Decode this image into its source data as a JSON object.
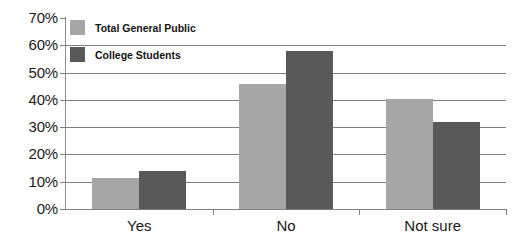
{
  "chart_data": {
    "type": "bar",
    "title": "",
    "subtitle": "",
    "xlabel": "",
    "ylabel": "",
    "categories": [
      "Yes",
      "No",
      "Not sure"
    ],
    "series": [
      {
        "name": "Total General Public",
        "color": "#a6a6a6",
        "values": [
          11.5,
          46,
          40.5
        ]
      },
      {
        "name": "College Students",
        "color": "#595959",
        "values": [
          14,
          58,
          32
        ]
      }
    ],
    "ylim": [
      0,
      70
    ],
    "ytick_values": [
      0,
      10,
      20,
      30,
      40,
      50,
      60,
      70
    ],
    "ytick_labels": [
      "0%",
      "10%",
      "20%",
      "30%",
      "40%",
      "50%",
      "60%",
      "70%"
    ],
    "gridline_values": [
      10,
      20,
      30,
      40,
      50,
      60
    ],
    "grid": true,
    "legend_position": "top-left",
    "value_format": "percent"
  },
  "legend": {
    "items": [
      {
        "label": "Total General Public",
        "color": "#a6a6a6"
      },
      {
        "label": "College Students",
        "color": "#595959"
      }
    ]
  }
}
